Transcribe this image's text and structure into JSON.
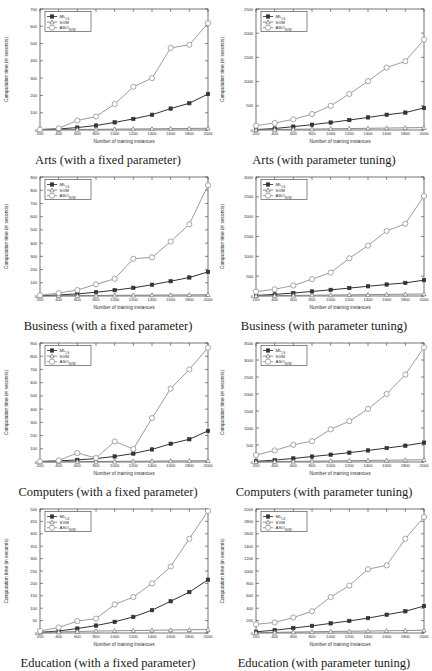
{
  "figure": {
    "panel_count": 8,
    "columns": 2,
    "rows": 4,
    "common_xlabel": "Number of training instances",
    "common_ylabel": "Computation time (in seconds)",
    "series_names": [
      "ML_LS",
      "SVM",
      "ASO_SVM"
    ],
    "legend_labels": [
      {
        "base": "ML",
        "sub": "LS"
      },
      {
        "base": "SVM",
        "sub": ""
      },
      {
        "base": "ASO",
        "sub": "SVM"
      }
    ],
    "colors": {
      "ml_ls": "#333333",
      "svm": "#777777",
      "aso_svm": "#8a8a8a",
      "axis": "#3a3a3a",
      "text": "#2b2b2b",
      "background": "#ffffff"
    },
    "markers": {
      "ml_ls": "square",
      "svm": "triangle",
      "aso_svm": "circle"
    }
  },
  "chart_data": [
    {
      "type": "line",
      "title": "Arts (with a fixed parameter)",
      "xlabel": "Number of training instances",
      "ylabel": "Computation time (in seconds)",
      "x": [
        200,
        400,
        600,
        800,
        1000,
        1200,
        1400,
        1600,
        1800,
        2000
      ],
      "xlim": [
        200,
        2000
      ],
      "ylim": [
        0,
        700
      ],
      "yticks": [
        0,
        100,
        200,
        300,
        400,
        500,
        600,
        700
      ],
      "xticks": [
        200,
        400,
        600,
        800,
        1000,
        1200,
        1400,
        1600,
        1800,
        2000
      ],
      "grid": false,
      "legend_position": "top-left",
      "series": [
        {
          "name": "ML_LS",
          "values": [
            2,
            6,
            14,
            26,
            44,
            64,
            88,
            124,
            155,
            208
          ]
        },
        {
          "name": "SVM",
          "values": [
            1,
            2,
            3,
            4,
            5,
            6,
            7,
            8,
            9,
            10
          ]
        },
        {
          "name": "ASO_SVM",
          "values": [
            3,
            10,
            55,
            78,
            150,
            250,
            300,
            475,
            493,
            618
          ]
        }
      ]
    },
    {
      "type": "line",
      "title": "Arts (with parameter tuning)",
      "xlabel": "Number of training instances",
      "ylabel": "Computation time (in seconds)",
      "x": [
        200,
        400,
        600,
        800,
        1000,
        1200,
        1400,
        1600,
        1800,
        2000
      ],
      "xlim": [
        200,
        2000
      ],
      "ylim": [
        0,
        2500
      ],
      "yticks": [
        0,
        500,
        1000,
        1500,
        2000,
        2500
      ],
      "xticks": [
        200,
        400,
        600,
        800,
        1000,
        1200,
        1400,
        1600,
        1800,
        2000
      ],
      "grid": false,
      "legend_position": "top-left",
      "series": [
        {
          "name": "ML_LS",
          "values": [
            10,
            30,
            70,
            110,
            155,
            205,
            260,
            315,
            360,
            455
          ]
        },
        {
          "name": "SVM",
          "values": [
            5,
            10,
            15,
            20,
            25,
            30,
            35,
            40,
            45,
            50
          ]
        },
        {
          "name": "ASO_SVM",
          "values": [
            90,
            145,
            220,
            330,
            500,
            745,
            1010,
            1290,
            1420,
            1870
          ]
        }
      ]
    },
    {
      "type": "line",
      "title": "Business (with a fixed parameter)",
      "xlabel": "Number of training instances",
      "ylabel": "Computation time (in seconds)",
      "x": [
        200,
        400,
        600,
        800,
        1000,
        1200,
        1400,
        1600,
        1800,
        2000
      ],
      "xlim": [
        200,
        2000
      ],
      "ylim": [
        0,
        900
      ],
      "yticks": [
        0,
        100,
        200,
        300,
        400,
        500,
        600,
        700,
        800,
        900
      ],
      "xticks": [
        200,
        400,
        600,
        800,
        1000,
        1200,
        1400,
        1600,
        1800,
        2000
      ],
      "grid": false,
      "legend_position": "top-left",
      "series": [
        {
          "name": "ML_LS",
          "values": [
            2,
            8,
            16,
            28,
            44,
            62,
            85,
            112,
            140,
            182
          ]
        },
        {
          "name": "SVM",
          "values": [
            1,
            2,
            3,
            4,
            5,
            6,
            7,
            8,
            9,
            10
          ]
        },
        {
          "name": "ASO_SVM",
          "values": [
            5,
            22,
            45,
            88,
            130,
            282,
            292,
            412,
            543,
            838
          ]
        }
      ]
    },
    {
      "type": "line",
      "title": "Business (with parameter tuning)",
      "xlabel": "Number of training instances",
      "ylabel": "Computation time (in seconds)",
      "x": [
        200,
        400,
        600,
        800,
        1000,
        1200,
        1400,
        1600,
        1800,
        2000
      ],
      "xlim": [
        200,
        2000
      ],
      "ylim": [
        0,
        3000
      ],
      "yticks": [
        0,
        500,
        1000,
        1500,
        2000,
        2500,
        3000
      ],
      "xticks": [
        200,
        400,
        600,
        800,
        1000,
        1200,
        1400,
        1600,
        1800,
        2000
      ],
      "grid": false,
      "legend_position": "top-left",
      "series": [
        {
          "name": "ML_LS",
          "values": [
            15,
            40,
            75,
            115,
            155,
            200,
            245,
            290,
            330,
            400
          ]
        },
        {
          "name": "SVM",
          "values": [
            5,
            10,
            15,
            20,
            25,
            30,
            35,
            40,
            45,
            50
          ]
        },
        {
          "name": "ASO_SVM",
          "values": [
            110,
            170,
            265,
            425,
            590,
            950,
            1270,
            1640,
            1820,
            2520
          ]
        }
      ]
    },
    {
      "type": "line",
      "title": "Computers (with a fixed parameter)",
      "xlabel": "Number of training instances",
      "ylabel": "Computation time (in seconds)",
      "x": [
        200,
        400,
        600,
        800,
        1000,
        1200,
        1400,
        1600,
        1800,
        2000
      ],
      "xlim": [
        200,
        2000
      ],
      "ylim": [
        0,
        900
      ],
      "yticks": [
        0,
        100,
        200,
        300,
        400,
        500,
        600,
        700,
        800,
        900
      ],
      "xticks": [
        200,
        400,
        600,
        800,
        1000,
        1200,
        1400,
        1600,
        1800,
        2000
      ],
      "grid": false,
      "legend_position": "top-left",
      "series": [
        {
          "name": "ML_LS",
          "values": [
            3,
            8,
            16,
            26,
            42,
            64,
            95,
            138,
            172,
            235
          ]
        },
        {
          "name": "SVM",
          "values": [
            1,
            2,
            3,
            4,
            5,
            6,
            7,
            8,
            9,
            10
          ]
        },
        {
          "name": "ASO_SVM",
          "values": [
            5,
            12,
            68,
            30,
            155,
            98,
            332,
            555,
            700,
            865
          ]
        }
      ]
    },
    {
      "type": "line",
      "title": "Computers (with parameter tuning)",
      "xlabel": "Number of training instances",
      "ylabel": "Computation time (in seconds)",
      "x": [
        200,
        400,
        600,
        800,
        1000,
        1200,
        1400,
        1600,
        1800,
        2000
      ],
      "xlim": [
        200,
        2000
      ],
      "ylim": [
        0,
        3500
      ],
      "yticks": [
        0,
        500,
        1000,
        1500,
        2000,
        2500,
        3000,
        3500
      ],
      "xticks": [
        200,
        400,
        600,
        800,
        1000,
        1200,
        1400,
        1600,
        1800,
        2000
      ],
      "grid": false,
      "legend_position": "top-left",
      "series": [
        {
          "name": "ML_LS",
          "values": [
            20,
            55,
            105,
            160,
            215,
            275,
            340,
            410,
            480,
            570
          ]
        },
        {
          "name": "SVM",
          "values": [
            5,
            12,
            18,
            25,
            32,
            38,
            45,
            52,
            58,
            65
          ]
        },
        {
          "name": "ASO_SVM",
          "values": [
            205,
            340,
            505,
            615,
            960,
            1200,
            1560,
            2000,
            2570,
            3370
          ]
        }
      ]
    },
    {
      "type": "line",
      "title": "Education (with a fixed parameter)",
      "xlabel": "Number of training instances",
      "ylabel": "Computation time (in seconds)",
      "x": [
        200,
        400,
        600,
        800,
        1000,
        1200,
        1400,
        1600,
        1800,
        2000
      ],
      "xlim": [
        200,
        2000
      ],
      "ylim": [
        0,
        500
      ],
      "yticks": [
        0,
        50,
        100,
        150,
        200,
        250,
        300,
        350,
        400,
        450,
        500
      ],
      "xticks": [
        200,
        400,
        600,
        800,
        1000,
        1200,
        1400,
        1600,
        1800,
        2000
      ],
      "grid": false,
      "legend_position": "top-left",
      "series": [
        {
          "name": "ML_LS",
          "values": [
            3,
            8,
            18,
            30,
            45,
            65,
            92,
            128,
            165,
            215
          ]
        },
        {
          "name": "SVM",
          "values": [
            2,
            4,
            6,
            8,
            9,
            10,
            11,
            12,
            13,
            14
          ]
        },
        {
          "name": "ASO_SVM",
          "values": [
            8,
            22,
            48,
            58,
            115,
            145,
            200,
            268,
            380,
            492
          ]
        }
      ]
    },
    {
      "type": "line",
      "title": "Education (with parameter tuning)",
      "xlabel": "Number of training instances",
      "ylabel": "Computation time (in seconds)",
      "x": [
        200,
        400,
        600,
        800,
        1000,
        1200,
        1400,
        1600,
        1800,
        2000
      ],
      "xlim": [
        200,
        2000
      ],
      "ylim": [
        0,
        2000
      ],
      "yticks": [
        0,
        200,
        400,
        600,
        800,
        1000,
        1200,
        1400,
        1600,
        1800,
        2000
      ],
      "xticks": [
        200,
        400,
        600,
        800,
        1000,
        1200,
        1400,
        1600,
        1800,
        2000
      ],
      "grid": false,
      "legend_position": "top-left",
      "series": [
        {
          "name": "ML_LS",
          "values": [
            20,
            45,
            80,
            115,
            155,
            195,
            240,
            295,
            350,
            435
          ]
        },
        {
          "name": "SVM",
          "values": [
            5,
            10,
            15,
            20,
            25,
            28,
            32,
            36,
            40,
            45
          ]
        },
        {
          "name": "ASO_SVM",
          "values": [
            140,
            170,
            250,
            350,
            580,
            765,
            1030,
            1090,
            1520,
            1870
          ]
        }
      ]
    }
  ]
}
